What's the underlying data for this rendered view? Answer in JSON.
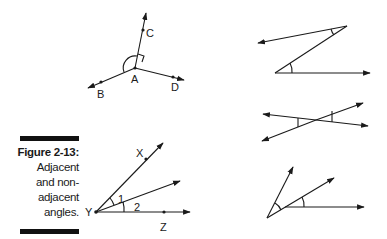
{
  "caption": {
    "title": "Figure 2-13:",
    "lines": [
      "Adjacent",
      "and non-",
      "adjacent",
      "angles."
    ]
  },
  "figure_abcd": {
    "labels": {
      "vertex": "A",
      "up": "C",
      "left": "B",
      "right": "D"
    }
  },
  "figure_xyz": {
    "labels": {
      "vertex": "Y",
      "top": "X",
      "bottom": "Z",
      "angle1": "1",
      "angle2": "2"
    }
  },
  "figures_right": [
    {
      "name": "z-shape-alternate-angles"
    },
    {
      "name": "crossing-lines-vertical-angles"
    },
    {
      "name": "non-adjacent-angles-separate-vertices"
    }
  ],
  "colors": {
    "ink": "#1a1a1a",
    "bar": "#111111",
    "background": "#ffffff"
  }
}
